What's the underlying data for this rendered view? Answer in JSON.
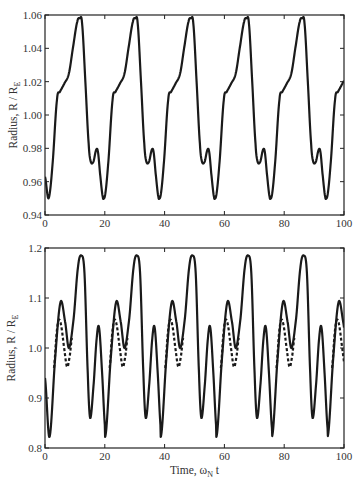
{
  "chart_data": [
    {
      "type": "line",
      "title": "",
      "xlabel": "",
      "ylabel": "Radius, R / R",
      "ylabel_sub": "E",
      "xlim": [
        0,
        100
      ],
      "ylim": [
        0.94,
        1.06
      ],
      "xticks": [
        0,
        20,
        40,
        60,
        80,
        100
      ],
      "xtick_labels": [
        "0",
        "20",
        "40",
        "60",
        "80",
        "100"
      ],
      "yticks": [
        0.94,
        0.96,
        0.98,
        1.0,
        1.02,
        1.04,
        1.06
      ],
      "ytick_labels": [
        "0.94",
        "0.96",
        "0.98",
        "1.00",
        "1.02",
        "1.04",
        "1.06"
      ],
      "grid": false,
      "period": 18.6,
      "series": [
        {
          "name": "solid",
          "style": "solid",
          "color": "#1a1a1a",
          "cycle_x": [
            0,
            1.2,
            2.5,
            4.0,
            5.0,
            6.5,
            8.0,
            9.5,
            10.8,
            11.6,
            12.4,
            13.5,
            14.6,
            15.3,
            16.2,
            17.1,
            17.7,
            18.4,
            19.3,
            19.8
          ],
          "cycle_y": [
            0.963,
            0.95,
            0.97,
            1.009,
            1.014,
            1.019,
            1.025,
            1.042,
            1.056,
            1.058,
            1.055,
            1.02,
            0.983,
            0.972,
            0.972,
            0.979,
            0.978,
            0.965,
            0.951,
            0.95
          ]
        }
      ]
    },
    {
      "type": "line",
      "title": "",
      "xlabel": "Time, ω",
      "xlabel_sub": "N",
      "xlabel_suffix": " t",
      "ylabel": "Radius, R / R",
      "ylabel_sub": "E",
      "xlim": [
        0,
        100
      ],
      "ylim": [
        0.8,
        1.2
      ],
      "xticks": [
        0,
        20,
        40,
        60,
        80,
        100
      ],
      "xtick_labels": [
        "0",
        "20",
        "40",
        "60",
        "80",
        "100"
      ],
      "yticks": [
        0.8,
        0.9,
        1.0,
        1.1,
        1.2
      ],
      "ytick_labels": [
        "0.8",
        "0.9",
        "1.0",
        "1.1",
        "1.2"
      ],
      "grid": false,
      "period": 18.6,
      "series": [
        {
          "name": "solid",
          "style": "solid",
          "color": "#1a1a1a",
          "cycle_x": [
            0,
            1.5,
            3.4,
            5.2,
            6.8,
            8.0,
            9.6,
            11.0,
            12.1,
            13.2,
            14.3,
            15.1,
            16.3,
            17.3,
            18.1,
            19.1,
            20.1,
            20.6
          ],
          "cycle_y": [
            0.94,
            0.822,
            0.98,
            1.092,
            1.05,
            1.0,
            1.06,
            1.16,
            1.185,
            1.15,
            0.95,
            0.86,
            0.93,
            1.02,
            1.04,
            0.95,
            0.84,
            0.835
          ]
        },
        {
          "name": "dashed",
          "style": "dashed",
          "color": "#1a1a1a",
          "cycle_x": [
            3.0,
            3.9,
            4.6,
            5.4,
            6.4,
            7.4,
            8.3,
            9.0
          ],
          "cycle_y": [
            0.96,
            1.03,
            1.056,
            1.045,
            1.0,
            0.962,
            0.985,
            1.02
          ]
        }
      ]
    }
  ]
}
